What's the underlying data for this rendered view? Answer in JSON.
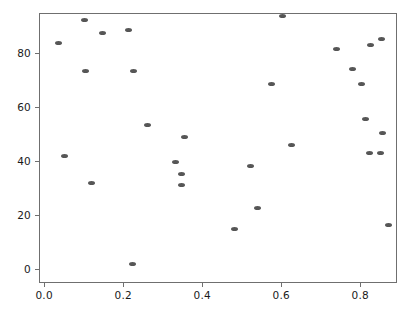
{
  "chart_data": {
    "type": "scatter",
    "title": "",
    "xlabel": "",
    "ylabel": "",
    "xlim": [
      -0.013,
      0.893
    ],
    "ylim": [
      -5.1,
      94.9
    ],
    "grid": false,
    "legend": null,
    "marker_color": "#565656",
    "frame_color": "#6f6f6f",
    "background": "#ffffff",
    "xticks": [
      0.0,
      0.2,
      0.4,
      0.6,
      0.8
    ],
    "xticklabels": [
      "0.0",
      "0.2",
      "0.4",
      "0.6",
      "0.8"
    ],
    "yticks": [
      0,
      20,
      40,
      60,
      80
    ],
    "yticklabels": [
      "0",
      "20",
      "40",
      "60",
      "80"
    ],
    "n_points": 35,
    "points": [
      {
        "x": 0.033,
        "y": 84.2
      },
      {
        "x": 0.048,
        "y": 42.3
      },
      {
        "x": 0.1,
        "y": 92.5
      },
      {
        "x": 0.101,
        "y": 73.8
      },
      {
        "x": 0.117,
        "y": 32.3
      },
      {
        "x": 0.144,
        "y": 87.8
      },
      {
        "x": 0.212,
        "y": 88.8
      },
      {
        "x": 0.22,
        "y": 2.2
      },
      {
        "x": 0.223,
        "y": 73.8
      },
      {
        "x": 0.259,
        "y": 53.8
      },
      {
        "x": 0.33,
        "y": 40.1
      },
      {
        "x": 0.344,
        "y": 31.4
      },
      {
        "x": 0.346,
        "y": 35.7
      },
      {
        "x": 0.352,
        "y": 49.5
      },
      {
        "x": 0.48,
        "y": 15.2
      },
      {
        "x": 0.519,
        "y": 38.5
      },
      {
        "x": 0.537,
        "y": 23.0
      },
      {
        "x": 0.573,
        "y": 69.0
      },
      {
        "x": 0.601,
        "y": 94.0
      },
      {
        "x": 0.623,
        "y": 46.5
      },
      {
        "x": 0.737,
        "y": 82.0
      },
      {
        "x": 0.777,
        "y": 74.6
      },
      {
        "x": 0.8,
        "y": 69.0
      },
      {
        "x": 0.812,
        "y": 56.0
      },
      {
        "x": 0.82,
        "y": 43.5
      },
      {
        "x": 0.823,
        "y": 83.4
      },
      {
        "x": 0.848,
        "y": 43.5
      },
      {
        "x": 0.852,
        "y": 85.8
      },
      {
        "x": 0.855,
        "y": 50.8
      },
      {
        "x": 0.868,
        "y": 16.6
      }
    ]
  }
}
